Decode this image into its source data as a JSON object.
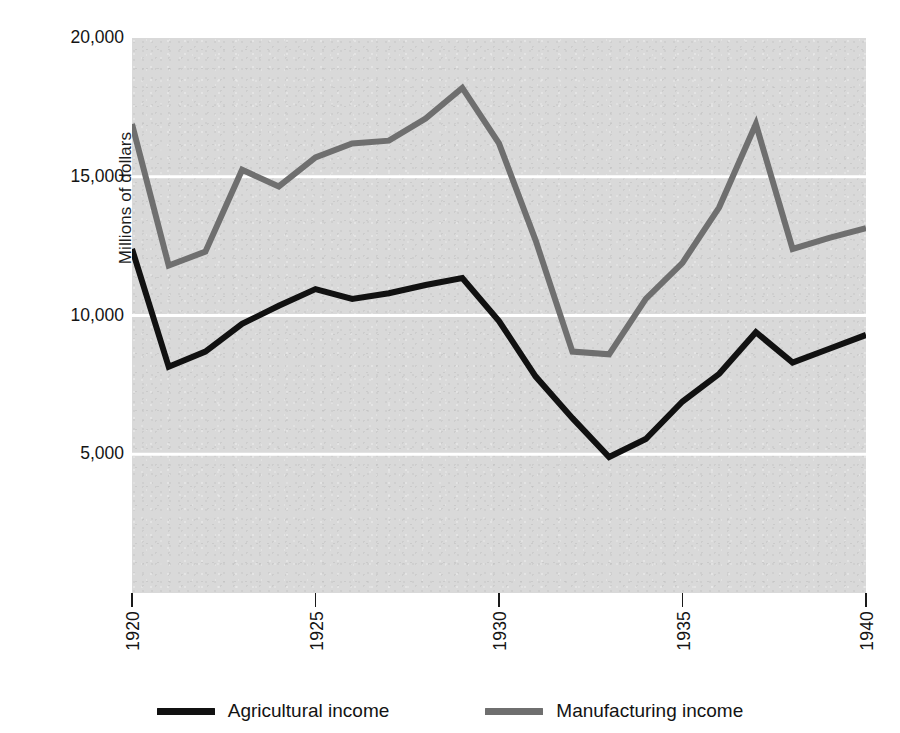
{
  "chart_data": {
    "type": "line",
    "title": "",
    "xlabel": "",
    "ylabel": "Millions of dollars",
    "x": [
      1920,
      1921,
      1922,
      1923,
      1924,
      1925,
      1926,
      1927,
      1928,
      1929,
      1930,
      1931,
      1932,
      1933,
      1934,
      1935,
      1936,
      1937,
      1938,
      1939,
      1940
    ],
    "xlim": [
      1920,
      1940
    ],
    "ylim": [
      0,
      20000
    ],
    "xtick_labels": [
      "1920",
      "1925",
      "1930",
      "1935",
      "1940"
    ],
    "xticks": [
      1920,
      1925,
      1930,
      1935,
      1940
    ],
    "ytick_labels": [
      "5,000",
      "10,000",
      "15,000",
      "20,000"
    ],
    "yticks": [
      5000,
      10000,
      15000,
      20000
    ],
    "grid": "horizontal",
    "legend_position": "bottom-center",
    "plot_background": "#d9d9d9",
    "gridline_color": "#ffffff",
    "series": [
      {
        "name": "Agricultural income",
        "color": "#111111",
        "values": [
          12400,
          8150,
          8700,
          9700,
          10350,
          10950,
          10600,
          10800,
          11100,
          11350,
          9800,
          7800,
          6300,
          4900,
          5550,
          6900,
          7900,
          9400,
          8300,
          8800,
          9300
        ]
      },
      {
        "name": "Manufacturing income",
        "color": "#6f6f6f",
        "values": [
          16900,
          11800,
          12300,
          15250,
          14650,
          15700,
          16200,
          16300,
          17100,
          18200,
          16200,
          12700,
          8700,
          8600,
          10600,
          11900,
          13900,
          16900,
          12400,
          12800,
          13150
        ]
      }
    ]
  },
  "axes": {
    "y_title": "Millions of dollars",
    "y_ticks": [
      {
        "label": "20,000",
        "value": 20000
      },
      {
        "label": "15,000",
        "value": 15000
      },
      {
        "label": "10,000",
        "value": 10000
      },
      {
        "label": "5,000",
        "value": 5000
      }
    ],
    "x_ticks": [
      {
        "label": "1920",
        "value": 1920
      },
      {
        "label": "1925",
        "value": 1925
      },
      {
        "label": "1930",
        "value": 1930
      },
      {
        "label": "1935",
        "value": 1935
      },
      {
        "label": "1940",
        "value": 1940
      }
    ]
  },
  "legend": {
    "items": [
      {
        "label": "Agricultural income",
        "color": "#111111"
      },
      {
        "label": "Manufacturing income",
        "color": "#6f6f6f"
      }
    ]
  }
}
